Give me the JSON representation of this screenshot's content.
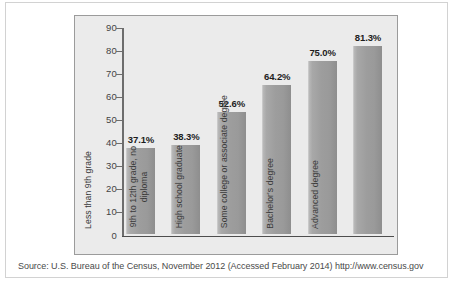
{
  "chart_data": {
    "type": "bar",
    "title": "",
    "xlabel": "",
    "ylabel": "",
    "ylim": [
      0,
      90
    ],
    "yticks": [
      90,
      80,
      70,
      60,
      50,
      40,
      30,
      20,
      10,
      0
    ],
    "grid": false,
    "legend": null,
    "categories": [
      "Less than 9th grade",
      "9th to 12th grade, no diploma",
      "High school graduate",
      "Some college or associate degree",
      "Bachelor's degree",
      "Advanced degree"
    ],
    "values": [
      37.1,
      38.3,
      52.6,
      64.2,
      75.0,
      81.3
    ],
    "data_labels": [
      "37.1%",
      "38.3%",
      "52.6%",
      "64.2%",
      "75.0%",
      "81.3%"
    ],
    "bar_label_lines": [
      [
        "Less than 9th",
        "grade"
      ],
      [
        "9th to 12th grade,",
        "no diploma"
      ],
      [
        "High school graduate"
      ],
      [
        "Some college or associate",
        "degree"
      ],
      [
        "Bachelor's degree"
      ],
      [
        "Advanced degree"
      ]
    ]
  },
  "figure": {
    "source_note": "Source: U.S. Bureau of the Census, November 2012 (Accessed February 2014) http://www.census.gov"
  },
  "colors": {
    "bar_fill": "#9a9a9a",
    "plot_background": "#ebebeb",
    "axis_line": "#4d4d4d",
    "card_border": "#d2d2d2"
  }
}
